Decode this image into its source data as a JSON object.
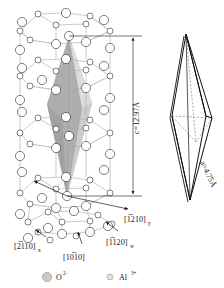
{
  "figure": {
    "kind": "crystal-structure-diagram",
    "background_color": "#ffffff"
  },
  "lattice": {
    "name": "hexagonal-unit-cell",
    "ion_large_label": "O2-",
    "ion_small_label": "Al3+",
    "large_ion_fill": "#c9c9c9",
    "large_ion_stroke": "#8d8d8d",
    "small_ion_fill": "#dedede",
    "small_ion_stroke": "#9a9a9a",
    "bond_color": "#a9a9a9",
    "shade_fill": "#8f8f8f",
    "shade_fill_light": "#c4c4c4"
  },
  "dimension": {
    "c_axis": {
      "name": "c-axis-dimension",
      "text": "c=12.97Å",
      "value": 12.97,
      "unit": "Å",
      "symbol": "c"
    },
    "a_axis": {
      "name": "a-axis-dimension",
      "text": "a=4.75Å",
      "value": 4.75,
      "unit": "Å",
      "symbol": "a"
    }
  },
  "directions": [
    {
      "name": "direction-1210-y",
      "text": "[1210]",
      "sub": "y"
    },
    {
      "name": "direction-2110-x",
      "text": "[2110]",
      "sub": "x"
    },
    {
      "name": "direction-1010",
      "text": "[1010]",
      "sub": ""
    },
    {
      "name": "direction-1120-w",
      "text": "[1120]",
      "sub": "w"
    }
  ],
  "rhombohedron": {
    "name": "rhombohedral-unit-cell",
    "edge_color": "#111111",
    "hidden_edge_color": "#6a6a6a"
  },
  "legend": {
    "items": [
      {
        "name": "legend-oxygen",
        "label": "O",
        "charge": "2−",
        "marker": "large-circle"
      },
      {
        "name": "legend-aluminum",
        "label": "Al",
        "charge": "3+",
        "marker": "small-circle"
      }
    ]
  }
}
